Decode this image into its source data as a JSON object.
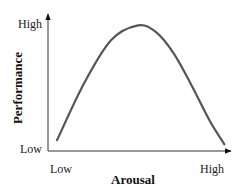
{
  "chart_data": {
    "type": "line",
    "title": "",
    "xlabel": "Arousal",
    "ylabel": "Performance",
    "x_ticks": [
      "Low",
      "High"
    ],
    "y_ticks": [
      "Low",
      "High"
    ],
    "xlim": [
      0,
      1
    ],
    "ylim": [
      0,
      1
    ],
    "grid": false,
    "legend": null,
    "series": [
      {
        "name": "Performance vs. Arousal",
        "color": "#555555",
        "x": [
          0.05,
          0.2,
          0.35,
          0.5,
          0.6,
          0.7,
          0.8,
          0.9,
          0.98
        ],
        "y": [
          0.08,
          0.5,
          0.82,
          0.93,
          0.88,
          0.72,
          0.48,
          0.22,
          0.05
        ]
      }
    ]
  }
}
